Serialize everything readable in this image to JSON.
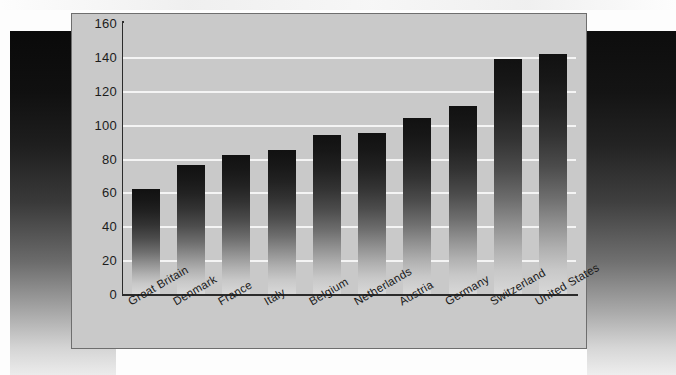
{
  "chart_data": {
    "type": "bar",
    "title": "",
    "subtitle": "",
    "xlabel": "",
    "ylabel": "",
    "categories": [
      "Great Britain",
      "Denmark",
      "France",
      "Italy",
      "Belgium",
      "Netherlands",
      "Austria",
      "Germany",
      "Switzerland",
      "United States"
    ],
    "values": [
      62,
      76,
      82,
      85,
      94,
      95,
      104,
      111,
      139,
      142
    ],
    "ylim": [
      0,
      160
    ],
    "ytick_labels": [
      "160",
      "140",
      "120",
      "100",
      "80",
      "60",
      "40",
      "20",
      "0"
    ],
    "ytick_values": [
      160,
      140,
      120,
      100,
      80,
      60,
      40,
      20,
      0
    ],
    "ytick_step": 20,
    "grid": true,
    "grid_orientation": "horizontal",
    "legend": false,
    "legend_position": "none",
    "bar_fill": "black-to-light-gray vertical gradient",
    "panel_color": "#c9c9c9",
    "gridline_color": "#f4f4f4",
    "axis_color": "#2b2b2b"
  },
  "panel": {
    "background_color": "#c9c9c9",
    "border_color": "#6e6e6e"
  },
  "decoration": {
    "left_edge_name": "left-dark-gradient-block",
    "right_edge_name": "right-dark-gradient-block"
  }
}
